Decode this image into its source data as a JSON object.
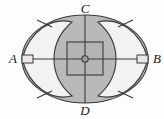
{
  "figure": {
    "canvas": {
      "width": 164,
      "height": 119,
      "background": "#fdfdfd"
    },
    "colors": {
      "background": "#fdfdfd",
      "ellipse_fill": "#b9b9b9",
      "lens_fill": "#f2f2f2",
      "stroke": "#3a3a3a",
      "label": "#1a1a1a",
      "square_fill": "#b4b4b4",
      "marker_fill": "#e8e8e8"
    },
    "ellipse": {
      "center_x": 85,
      "center_y": 59,
      "radius_x": 63,
      "radius_y": 44
    },
    "axes": {
      "horizontal": {
        "from": "A",
        "to": "B",
        "y": 59,
        "x1": 22,
        "x2": 148
      },
      "vertical": {
        "from": "C",
        "to": "D",
        "x": 85,
        "y1": 15,
        "y2": 103
      }
    },
    "vertices": [
      {
        "name": "A",
        "label": "A",
        "x": 17,
        "y": 63,
        "anchor": "end",
        "position": "left"
      },
      {
        "name": "B",
        "label": "B",
        "x": 153,
        "y": 63,
        "anchor": "start",
        "position": "right"
      },
      {
        "name": "C",
        "label": "C",
        "x": 85,
        "y": 13,
        "anchor": "middle",
        "position": "top"
      },
      {
        "name": "D",
        "label": "D",
        "x": 85,
        "y": 114,
        "anchor": "middle",
        "position": "bottom"
      }
    ],
    "center_square": {
      "x": 67,
      "y": 42,
      "width": 36,
      "height": 33
    },
    "center_point": {
      "x": 85,
      "y": 59,
      "radius": 3.2
    },
    "edge_markers": [
      {
        "name": "marker-a",
        "x": 22,
        "y": 55,
        "width": 11,
        "height": 8
      },
      {
        "name": "marker-b",
        "x": 137,
        "y": 55,
        "width": 11,
        "height": 8
      }
    ],
    "lens_shapes": [
      {
        "name": "left-lens",
        "side": "left",
        "tip_x": 22,
        "base_x": 72
      },
      {
        "name": "right-lens",
        "side": "right",
        "tip_x": 148,
        "base_x": 98
      }
    ],
    "radial_lines": [
      {
        "name": "radial-upper-left",
        "x1": 52,
        "y1": 27,
        "x2": 37,
        "y2": 21
      },
      {
        "name": "radial-lower-left",
        "x1": 52,
        "y1": 91,
        "x2": 37,
        "y2": 97
      },
      {
        "name": "radial-upper-right",
        "x1": 118,
        "y1": 27,
        "x2": 133,
        "y2": 21
      },
      {
        "name": "radial-lower-right",
        "x1": 118,
        "y1": 91,
        "x2": 133,
        "y2": 97
      }
    ]
  }
}
